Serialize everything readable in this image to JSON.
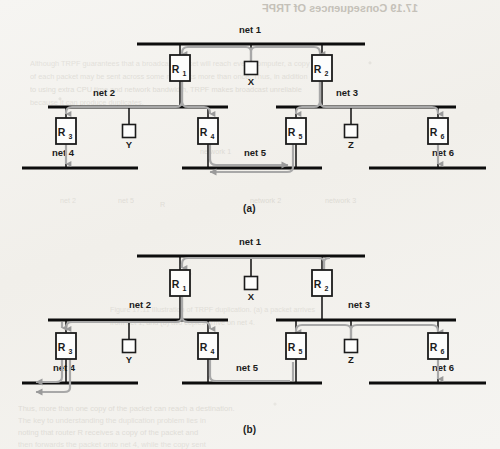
{
  "figure": {
    "title_bleed": "17.19 Consequences Of TRPF",
    "panels": [
      {
        "id": "a",
        "caption": "(a)",
        "networks": [
          {
            "name": "net 1",
            "label_x": 250,
            "label_y": 33,
            "bus_x1": 137,
            "bus_x2": 365,
            "bus_y": 44
          },
          {
            "name": "net 2",
            "label_x": 104,
            "label_y": 96,
            "bus_x1": 48,
            "bus_x2": 228,
            "bus_y": 107
          },
          {
            "name": "net 3",
            "label_x": 347,
            "label_y": 96,
            "bus_x1": 276,
            "bus_x2": 456,
            "bus_y": 107
          },
          {
            "name": "net 4",
            "label_x": 63,
            "label_y": 156,
            "bus_x1": 22,
            "bus_x2": 138,
            "bus_y": 168
          },
          {
            "name": "net 5",
            "label_x": 255,
            "label_y": 156,
            "bus_x1": 182,
            "bus_x2": 322,
            "bus_y": 168
          },
          {
            "name": "net 6",
            "label_x": 443,
            "label_y": 156,
            "bus_x1": 369,
            "bus_x2": 486,
            "bus_y": 168
          }
        ],
        "routers": [
          {
            "name": "R",
            "sub": "1",
            "x": 180,
            "y": 68
          },
          {
            "name": "R",
            "sub": "2",
            "x": 322,
            "y": 68
          },
          {
            "name": "R",
            "sub": "3",
            "x": 66,
            "y": 131
          },
          {
            "name": "R",
            "sub": "4",
            "x": 208,
            "y": 131
          },
          {
            "name": "R",
            "sub": "5",
            "x": 296,
            "y": 131
          },
          {
            "name": "R",
            "sub": "6",
            "x": 438,
            "y": 131
          }
        ],
        "hosts": [
          {
            "name": "X",
            "x": 251,
            "y": 68
          },
          {
            "name": "Y",
            "x": 129,
            "y": 131
          },
          {
            "name": "Z",
            "x": 351,
            "y": 131
          }
        ]
      },
      {
        "id": "b",
        "caption": "(b)",
        "networks": [
          {
            "name": "net 1",
            "label_x": 250,
            "label_y": 245,
            "bus_x1": 137,
            "bus_x2": 365,
            "bus_y": 256
          },
          {
            "name": "net 2",
            "label_x": 140,
            "label_y": 308,
            "bus_x1": 48,
            "bus_x2": 228,
            "bus_y": 320
          },
          {
            "name": "net 3",
            "label_x": 359,
            "label_y": 308,
            "bus_x1": 276,
            "bus_x2": 456,
            "bus_y": 320
          },
          {
            "name": "net 4",
            "label_x": 64,
            "label_y": 371,
            "bus_x1": 22,
            "bus_x2": 138,
            "bus_y": 383
          },
          {
            "name": "net 5",
            "label_x": 247,
            "label_y": 371,
            "bus_x1": 182,
            "bus_x2": 322,
            "bus_y": 383
          },
          {
            "name": "net 6",
            "label_x": 443,
            "label_y": 371,
            "bus_x1": 369,
            "bus_x2": 486,
            "bus_y": 383
          }
        ],
        "routers": [
          {
            "name": "R",
            "sub": "1",
            "x": 180,
            "y": 283
          },
          {
            "name": "R",
            "sub": "2",
            "x": 322,
            "y": 283
          },
          {
            "name": "R",
            "sub": "3",
            "x": 66,
            "y": 346
          },
          {
            "name": "R",
            "sub": "4",
            "x": 208,
            "y": 346
          },
          {
            "name": "R",
            "sub": "5",
            "x": 296,
            "y": 346
          },
          {
            "name": "R",
            "sub": "6",
            "x": 438,
            "y": 346
          }
        ],
        "hosts": [
          {
            "name": "X",
            "x": 251,
            "y": 283
          },
          {
            "name": "Y",
            "x": 129,
            "y": 346
          },
          {
            "name": "Z",
            "x": 351,
            "y": 346
          }
        ]
      }
    ],
    "colors": {
      "ink": "#1b1b1b",
      "bus": "#0d0d0d",
      "trace": "#a8a8a8",
      "trace_dark": "#8e8e8e",
      "paper": "#f4f3f0",
      "ghost": "#b9b5ac"
    }
  },
  "background_text": {
    "lines": [
      {
        "text": "Although TRPF guarantees that a broadcast packet will reach every computer, a copy",
        "x": 30,
        "y": 59,
        "size": 7.4,
        "mirror": false
      },
      {
        "text": "of each packet may be sent across some networks more than once. Thus, in addition",
        "x": 30,
        "y": 72,
        "size": 7.4,
        "mirror": false
      },
      {
        "text": "to using extra CPU time and network bandwidth, TRPF makes broadcast unreliable",
        "x": 30,
        "y": 85,
        "size": 7.4,
        "mirror": false
      },
      {
        "text": "because it can produce duplicates.",
        "x": 30,
        "y": 98,
        "size": 7.4,
        "mirror": false
      },
      {
        "text": "network 1",
        "x": 200,
        "y": 147,
        "size": 7.2,
        "mirror": false
      },
      {
        "text": "net 2",
        "x": 60,
        "y": 196,
        "size": 7.2,
        "mirror": false
      },
      {
        "text": "net 5",
        "x": 118,
        "y": 196,
        "size": 7.2,
        "mirror": false
      },
      {
        "text": "network 2",
        "x": 250,
        "y": 196,
        "size": 7.2,
        "mirror": false
      },
      {
        "text": "R",
        "x": 160,
        "y": 200,
        "size": 7.2,
        "mirror": false
      },
      {
        "text": "network 3",
        "x": 325,
        "y": 196,
        "size": 7.2,
        "mirror": false
      },
      {
        "text": "Figure 17.11 Illustration of TRPF duplication. (a) a packet arrives",
        "x": 110,
        "y": 305,
        "size": 7.2,
        "mirror": false
      },
      {
        "text": "from net 1, and (b) two copies arrive on net 4.",
        "x": 110,
        "y": 318,
        "size": 7.2,
        "mirror": false
      },
      {
        "text": "Thus, more than one copy of the packet can reach a destination.",
        "x": 18,
        "y": 404,
        "size": 7.6,
        "mirror": false
      },
      {
        "text": "The key to understanding the duplication problem lies in",
        "x": 18,
        "y": 416,
        "size": 7.6,
        "mirror": false
      },
      {
        "text": "noting that router R receives a copy of the packet and",
        "x": 18,
        "y": 428,
        "size": 7.6,
        "mirror": false
      },
      {
        "text": "then forwards the packet onto net 4, while the copy sent",
        "x": 18,
        "y": 440,
        "size": 7.6,
        "mirror": false
      }
    ],
    "mirrored_header": {
      "text": "17.19 Consequences Of TRPF",
      "x": 262,
      "y": 8,
      "size": 11
    }
  }
}
